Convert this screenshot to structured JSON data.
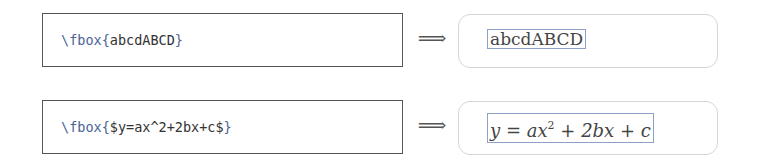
{
  "rows": [
    {
      "code": {
        "command": "\\fbox",
        "open_brace": "{",
        "argument": "abcdABCD",
        "close_brace": "}"
      },
      "arrow": "⟹",
      "result": {
        "type": "text",
        "text": "abcdABCD"
      }
    },
    {
      "code": {
        "command": "\\fbox",
        "open_brace": "{",
        "argument": "$y=ax^2+2bx+c$",
        "close_brace": "}"
      },
      "arrow": "⟹",
      "result": {
        "type": "math",
        "y": "y",
        "eq": " = ",
        "ax": "ax",
        "exp": "2",
        "plus1": " + ",
        "twobx": "2bx",
        "plus2": " + ",
        "c": "c"
      }
    }
  ],
  "colors": {
    "command": "#4a6496",
    "code_text": "#333333",
    "code_border": "#555555",
    "result_border": "#d6d6d6",
    "fbox_border": "#8ea0c8"
  }
}
